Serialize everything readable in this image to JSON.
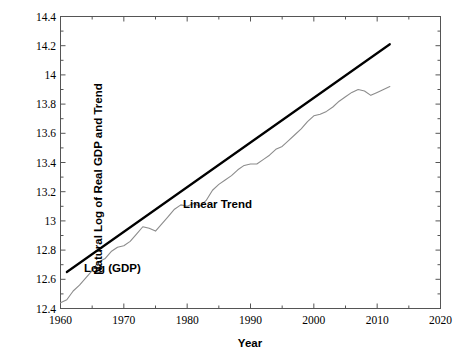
{
  "chart_data": {
    "type": "line",
    "title": "",
    "xlabel": "Year",
    "ylabel": "Natural Log of Real GDP and Trend",
    "xlim": [
      1960,
      2020
    ],
    "ylim": [
      12.4,
      14.4
    ],
    "grid": false,
    "legend_position": "inline-annotations",
    "xticks": [
      1960,
      1970,
      1980,
      1990,
      2000,
      2010,
      2020
    ],
    "xtick_labels": [
      "1960",
      "1970",
      "1980",
      "1990",
      "2000",
      "2010",
      "2020"
    ],
    "x_minor_tick_interval": 5,
    "yticks": [
      12.4,
      12.6,
      12.8,
      13,
      13.2,
      13.4,
      13.6,
      13.8,
      14,
      14.2,
      14.4
    ],
    "ytick_labels": [
      "12.4",
      "12.6",
      "12.8",
      "13",
      "13.2",
      "13.4",
      "13.6",
      "13.8",
      "14",
      "14.2",
      "14.4"
    ],
    "y_minor_tick_interval": 0.1,
    "series": [
      {
        "name": "Log (GDP)",
        "color": "#8c8c8c",
        "line_width": 1.1,
        "style": "solid",
        "annotation_label": "Log (GDP)",
        "x": [
          1960,
          1961,
          1962,
          1963,
          1964,
          1965,
          1966,
          1967,
          1968,
          1969,
          1970,
          1971,
          1972,
          1973,
          1974,
          1975,
          1976,
          1977,
          1978,
          1979,
          1980,
          1981,
          1982,
          1983,
          1984,
          1985,
          1986,
          1987,
          1988,
          1989,
          1990,
          1991,
          1992,
          1993,
          1994,
          1995,
          1996,
          1997,
          1998,
          1999,
          2000,
          2001,
          2002,
          2003,
          2004,
          2005,
          2006,
          2007,
          2008,
          2009,
          2010,
          2011,
          2012
        ],
        "values": [
          12.44,
          12.46,
          12.52,
          12.56,
          12.61,
          12.66,
          12.72,
          12.74,
          12.79,
          12.82,
          12.83,
          12.86,
          12.91,
          12.96,
          12.95,
          12.93,
          12.98,
          13.03,
          13.08,
          13.11,
          13.1,
          13.12,
          13.1,
          13.14,
          13.21,
          13.25,
          13.28,
          13.31,
          13.35,
          13.38,
          13.39,
          13.39,
          13.42,
          13.45,
          13.49,
          13.51,
          13.55,
          13.59,
          13.63,
          13.68,
          13.72,
          13.73,
          13.75,
          13.78,
          13.82,
          13.85,
          13.88,
          13.9,
          13.89,
          13.86,
          13.88,
          13.9,
          13.92
        ]
      },
      {
        "name": "Linear Trend",
        "color": "#000000",
        "line_width": 2.2,
        "style": "solid",
        "annotation_label": "Linear Trend",
        "x": [
          1961,
          2012
        ],
        "values": [
          12.65,
          14.21
        ]
      }
    ]
  },
  "axes": {
    "y_title": "Natural Log of Real GDP and Trend",
    "x_title": "Year"
  },
  "annotations": {
    "log_gdp": "Log (GDP)",
    "linear_trend": "Linear Trend"
  },
  "colors": {
    "series_gdp": "#8c8c8c",
    "series_trend": "#000000",
    "axis": "#555555",
    "background": "#ffffff"
  }
}
